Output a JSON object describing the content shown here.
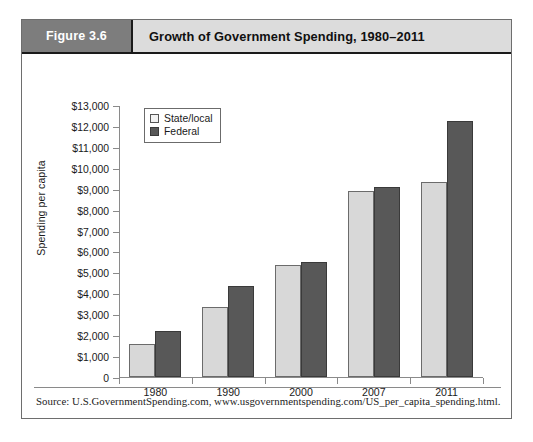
{
  "figure": {
    "number_label": "Figure 3.6",
    "title": "Growth of Government Spending, 1980–2011",
    "source": "Source: U.S.GovernmentSpending.com, www.usgovernmentspending.com/US_per_capita_spending.html."
  },
  "colors": {
    "header_number_bg": "#7d7d7d",
    "header_title_bg": "#dcdcdc",
    "state_local_bar": "#d8d8d8",
    "federal_bar": "#585858",
    "axis": "#8a8a8a",
    "frame": "#6e6e6e"
  },
  "chart_data": {
    "type": "bar",
    "title": "Growth of Government Spending, 1980–2011",
    "xlabel": "",
    "ylabel": "Spending per capita",
    "categories": [
      "1980",
      "1990",
      "2000",
      "2007",
      "2011"
    ],
    "series": [
      {
        "name": "State/local",
        "values": [
          1600,
          3350,
          5350,
          8900,
          9300
        ]
      },
      {
        "name": "Federal",
        "values": [
          2200,
          4350,
          5500,
          9100,
          12250
        ]
      }
    ],
    "ylim": [
      0,
      13000
    ],
    "ytick_step": 1000,
    "ytick_labels": [
      "$13,000",
      "$12,000",
      "$11,000",
      "$10,000",
      "$9,000",
      "$8,000",
      "$7,000",
      "$6,000",
      "$5,000",
      "$4,000",
      "$3,000",
      "$2,000",
      "$1,000",
      "0"
    ],
    "ytick_values": [
      13000,
      12000,
      11000,
      10000,
      9000,
      8000,
      7000,
      6000,
      5000,
      4000,
      3000,
      2000,
      1000,
      0
    ],
    "grid": false,
    "legend_position": "top-left",
    "legend_entries": [
      "State/local",
      "Federal"
    ]
  }
}
